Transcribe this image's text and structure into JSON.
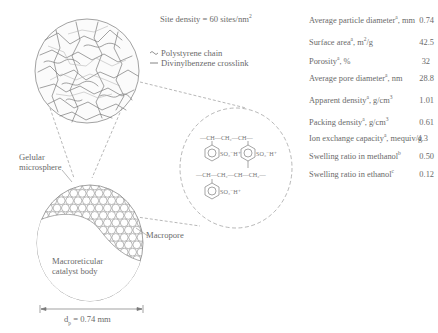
{
  "site_density": {
    "label": "Site density = 60 sites/nm",
    "sup": "2"
  },
  "legend": {
    "items": [
      {
        "symbol": "wavy-line",
        "label": "Polystyrene chain"
      },
      {
        "symbol": "straight-line",
        "label": "Divinylbenzene crosslink"
      }
    ]
  },
  "labels": {
    "gelular_line1": "Gelular",
    "gelular_line2": "microsphere",
    "macropore": "Macropore",
    "catalyst_line1": "Macroreticular",
    "catalyst_line2": "catalyst body",
    "diameter": "d",
    "diameter_sub": "p",
    "diameter_value": " = 0.74 mm"
  },
  "chemistry": {
    "row1": [
      "CH",
      "CH₂",
      "CH"
    ],
    "row2": [
      "CH",
      "CH₂",
      "CH",
      "CH₂"
    ],
    "sulfonic": "SO₃⁻H⁺",
    "ring_count": 4
  },
  "properties": [
    {
      "label": "Average particle diameter",
      "sup": "a",
      "unit": ", mm",
      "value": "0.74"
    },
    {
      "label": "Surface area",
      "sup": "a",
      "unit": ", m",
      "unit_sup": "2",
      "unit_tail": "/g",
      "value": "42.5"
    },
    {
      "label": "Porosity",
      "sup": "a",
      "unit": ", %",
      "value": "32"
    },
    {
      "label": "Average pore diameter",
      "sup": "a",
      "unit": ", nm",
      "value": "28.8"
    },
    {
      "label": "Apparent density",
      "sup": "a",
      "unit": ", g/cm",
      "unit_sup": "3",
      "value": "1.01"
    },
    {
      "label": "Packing density",
      "sup": "a",
      "unit": ", g/cm",
      "unit_sup": "3",
      "value": "0.61"
    },
    {
      "label": "Ion exchange capacity",
      "sup": "a",
      "unit": ", mequiv/g",
      "value": "4.3"
    },
    {
      "label": "Swelling ratio in methanol",
      "sup": "b",
      "unit": "",
      "value": "0.50"
    },
    {
      "label": "Swelling ratio in ethanol",
      "sup": "c",
      "unit": "",
      "value": "0.12"
    }
  ]
}
